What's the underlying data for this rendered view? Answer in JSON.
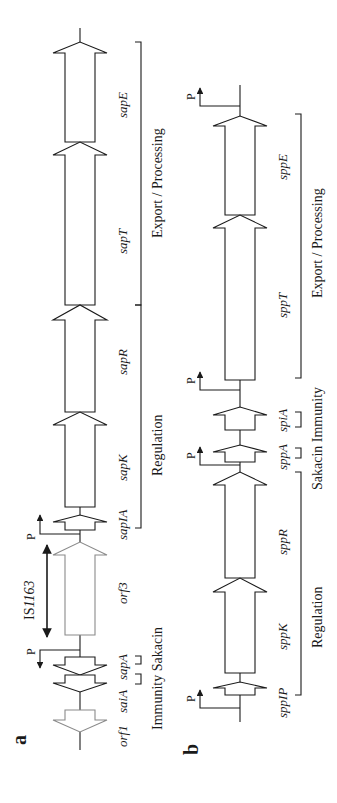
{
  "figure": {
    "orientation": "rotated 90° counter-clockwise",
    "panels": [
      {
        "id": "a",
        "label": "a",
        "genes": [
          {
            "name": "orf1",
            "label": "orf1",
            "direction": "reverse",
            "style": "gray"
          },
          {
            "name": "saiA",
            "label": "saiA",
            "direction": "reverse",
            "style": "black"
          },
          {
            "name": "sapA",
            "label": "sapA",
            "direction": "reverse",
            "style": "black"
          },
          {
            "name": "orf3",
            "label": "orf3",
            "direction": "forward",
            "style": "gray"
          },
          {
            "name": "sapIA",
            "label": "sapIA",
            "direction": "forward",
            "style": "black"
          },
          {
            "name": "sapK",
            "label": "sapK",
            "direction": "forward",
            "style": "black"
          },
          {
            "name": "sapR",
            "label": "sapR",
            "direction": "forward",
            "style": "black"
          },
          {
            "name": "sapT",
            "label": "sapT",
            "direction": "forward",
            "style": "black"
          },
          {
            "name": "sapE",
            "label": "sapE",
            "direction": "forward",
            "style": "black"
          }
        ],
        "promoters": [
          {
            "label": "P",
            "position": "between sapA and orf3",
            "direction": "reverse"
          },
          {
            "label": "P",
            "position": "upstream of sapIA",
            "direction": "forward"
          }
        ],
        "insertion_element": {
          "label_prefix": "IS",
          "label_italic": "1163",
          "label": "IS1163"
        },
        "groups": [
          {
            "label": "Immunity",
            "genes": [
              "saiA"
            ]
          },
          {
            "label": "Sakacin",
            "genes": [
              "sapA"
            ]
          },
          {
            "label": "Regulation",
            "genes": [
              "sapIA",
              "sapK",
              "sapR"
            ]
          },
          {
            "label": "Export / Processing",
            "genes": [
              "sapT",
              "sapE"
            ]
          }
        ]
      },
      {
        "id": "b",
        "label": "b",
        "genes": [
          {
            "name": "sppIP",
            "label": "sppIP",
            "direction": "forward",
            "style": "black"
          },
          {
            "name": "sppK",
            "label": "sppK",
            "direction": "forward",
            "style": "black"
          },
          {
            "name": "sppR",
            "label": "sppR",
            "direction": "forward",
            "style": "black"
          },
          {
            "name": "sppA",
            "label": "sppA",
            "direction": "forward",
            "style": "black"
          },
          {
            "name": "spiA",
            "label": "spiA",
            "direction": "forward",
            "style": "black"
          },
          {
            "name": "sppT",
            "label": "sppT",
            "direction": "forward",
            "style": "black"
          },
          {
            "name": "sppE",
            "label": "sppE",
            "direction": "forward",
            "style": "black"
          }
        ],
        "promoters": [
          {
            "label": "P",
            "position": "upstream of sppIP",
            "direction": "forward"
          },
          {
            "label": "P",
            "position": "upstream of sppA",
            "direction": "forward"
          },
          {
            "label": "P",
            "position": "upstream of sppT",
            "direction": "forward"
          },
          {
            "label": "P",
            "position": "downstream of sppE",
            "direction": "forward"
          }
        ],
        "groups": [
          {
            "label": "Regulation",
            "genes": [
              "sppIP",
              "sppK",
              "sppR"
            ]
          },
          {
            "label": "Sakacin",
            "genes": [
              "sppA"
            ]
          },
          {
            "label": "Immunity",
            "genes": [
              "spiA"
            ]
          },
          {
            "label": "Export / Processing",
            "genes": [
              "sppT",
              "sppE"
            ]
          }
        ]
      }
    ],
    "text": {
      "a_label": "a",
      "b_label": "b",
      "P": "P",
      "IS_prefix": "IS",
      "IS_num": "1163",
      "a_orf1": "orf1",
      "a_saiA": "saiA",
      "a_sapA": "sapA",
      "a_orf3": "orf3",
      "a_sapIA": "sapIA",
      "a_sapK": "sapK",
      "a_sapR": "sapR",
      "a_sapT": "sapT",
      "a_sapE": "sapE",
      "a_immunity_sakacin": "Immunity Sakacin",
      "a_regulation": "Regulation",
      "a_export": "Export / Processing",
      "b_sppIP": "sppIP",
      "b_sppK": "sppK",
      "b_sppR": "sppR",
      "b_sppA": "sppA",
      "b_spiA": "spiA",
      "b_sppT": "sppT",
      "b_sppE": "sppE",
      "b_regulation": "Regulation",
      "b_sakacin_immunity": "Sakacin Immunity",
      "b_export": "Export / Processing"
    },
    "colors": {
      "stroke": "#1a1a1a",
      "gray_stroke": "#8a8a8a",
      "background": "#ffffff"
    }
  }
}
